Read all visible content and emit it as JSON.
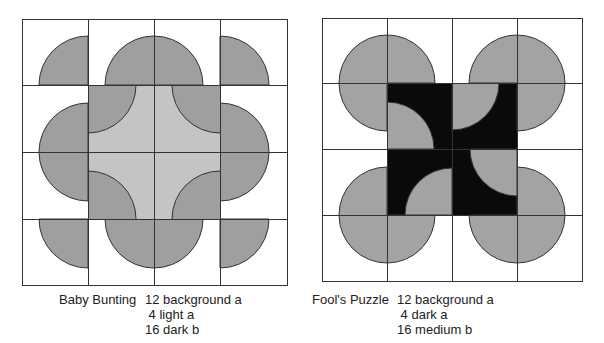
{
  "colors": {
    "background": "#ffffff",
    "light": "#c4c4c4",
    "dark": "#9f9f9f",
    "medium": "#a3a3a3",
    "black": "#0a0a0a",
    "line": "#333333"
  },
  "quilts": [
    {
      "name": "Baby Bunting",
      "counts": [
        "12 background a",
        " 4 light a",
        "16 dark b"
      ]
    },
    {
      "name": "Fool's Puzzle",
      "counts": [
        "12 background a",
        " 4 dark a",
        "16 medium b"
      ]
    }
  ]
}
